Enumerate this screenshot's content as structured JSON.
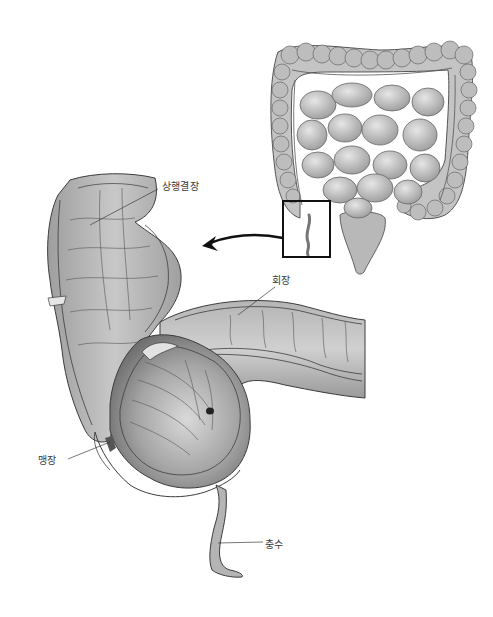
{
  "figure": {
    "labels": {
      "ascending_colon": "상행결장",
      "ileum": "회장",
      "cecum": "맹장",
      "appendix": "충수"
    },
    "inset": {
      "subject": "intestines-overview",
      "highlight_box": "ileocecal-region"
    },
    "colors": {
      "background": "#ffffff",
      "tissue_light": "#cfcfcf",
      "tissue_mid": "#a9a9a9",
      "tissue_dark": "#6e6e6e",
      "outline": "#3c3c3c",
      "arrow": "#111111",
      "label_text": "#3a3a3a"
    }
  }
}
